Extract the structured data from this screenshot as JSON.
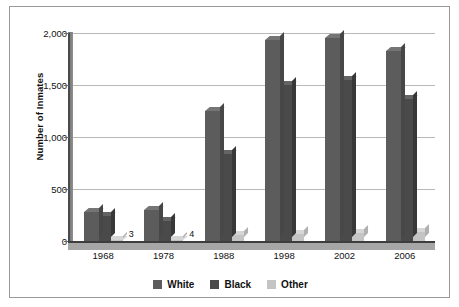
{
  "chart_data": {
    "type": "bar",
    "title": "",
    "xlabel": "",
    "ylabel": "Number of Inmates",
    "categories": [
      "1968",
      "1978",
      "1988",
      "1998",
      "2002",
      "2006"
    ],
    "series": [
      {
        "name": "White",
        "color": "#5c5c5c",
        "values": [
          280,
          300,
          1250,
          1930,
          1950,
          1830
        ]
      },
      {
        "name": "Black",
        "color": "#4a4a4a",
        "values": [
          240,
          190,
          840,
          1500,
          1550,
          1370
        ]
      },
      {
        "name": "Other",
        "color": "#c4c4c4",
        "values": [
          3,
          4,
          55,
          70,
          80,
          85
        ]
      }
    ],
    "ylim": [
      0,
      2000
    ],
    "yticks": [
      0,
      500,
      1000,
      1500,
      2000
    ],
    "ytick_labels": [
      "0",
      "500",
      "1,000",
      "1,500",
      "2,000"
    ],
    "grid": true,
    "legend_position": "bottom",
    "annotations": [
      {
        "text": "3",
        "category": "1968",
        "series": "Other"
      },
      {
        "text": "4",
        "category": "1978",
        "series": "Other"
      }
    ]
  },
  "axis": {
    "y_title": "Number of Inmates"
  },
  "legend": {
    "items": [
      {
        "label": "White",
        "color": "#5c5c5c"
      },
      {
        "label": "Black",
        "color": "#4a4a4a"
      },
      {
        "label": "Other",
        "color": "#c4c4c4"
      }
    ]
  }
}
